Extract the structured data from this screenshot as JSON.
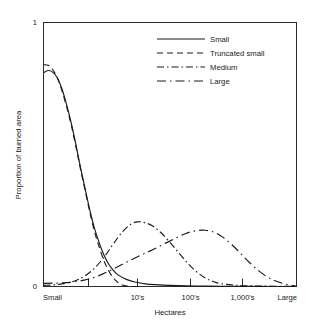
{
  "chart_data": {
    "type": "line",
    "title": "",
    "subtitle": "",
    "xlabel": "Hectares",
    "ylabel": "Proportion of burned area",
    "grid": false,
    "legend_position": "top-right",
    "xlim": [
      0,
      1
    ],
    "ylim": [
      0,
      1
    ],
    "y_ticks": [
      0,
      1
    ],
    "y_tick_labels": [
      "0",
      "1"
    ],
    "x_ticks": [
      0.0,
      0.1765,
      0.3725,
      0.5804,
      0.7843,
      1.0
    ],
    "x_tick_labels": [
      "Small",
      "",
      "10's",
      "100's",
      "1,000's",
      "Large"
    ],
    "x_major_tick_labels": [
      "Small",
      "10's",
      "100's",
      "1,000's",
      "Large"
    ],
    "annotations": [],
    "series": [
      {
        "name": "Small",
        "style": "solid",
        "dash": "none",
        "color": "#1a1a1a",
        "x": [
          0.0,
          0.018,
          0.036,
          0.055,
          0.073,
          0.091,
          0.11,
          0.128,
          0.146,
          0.165,
          0.183,
          0.201,
          0.22,
          0.238,
          0.256,
          0.275,
          0.293,
          0.33,
          0.366,
          0.403,
          0.44,
          0.5,
          0.6,
          0.7,
          0.8,
          0.9,
          1.0
        ],
        "y": [
          0.81,
          0.818,
          0.812,
          0.79,
          0.748,
          0.69,
          0.618,
          0.538,
          0.452,
          0.368,
          0.29,
          0.222,
          0.166,
          0.121,
          0.087,
          0.062,
          0.045,
          0.026,
          0.016,
          0.01,
          0.007,
          0.004,
          0.002,
          0.001,
          0.001,
          0.0,
          0.0
        ]
      },
      {
        "name": "Truncated small",
        "style": "dashed",
        "dash": "6,4",
        "color": "#1a1a1a",
        "x": [
          0.0,
          0.018,
          0.036,
          0.055,
          0.073,
          0.091,
          0.11,
          0.128,
          0.146,
          0.165,
          0.183,
          0.201,
          0.22,
          0.238,
          0.256,
          0.275,
          0.293,
          0.311,
          0.33,
          0.35,
          0.38
        ],
        "y": [
          0.84,
          0.838,
          0.822,
          0.79,
          0.742,
          0.682,
          0.61,
          0.53,
          0.446,
          0.362,
          0.282,
          0.21,
          0.15,
          0.1,
          0.062,
          0.034,
          0.016,
          0.006,
          0.002,
          0.0,
          0.0
        ]
      },
      {
        "name": "Medium",
        "style": "dash-dot",
        "dash": "7,3,1.5,3",
        "color": "#1a1a1a",
        "x": [
          0.0,
          0.06,
          0.12,
          0.16,
          0.2,
          0.24,
          0.275,
          0.31,
          0.345,
          0.373,
          0.4,
          0.43,
          0.46,
          0.49,
          0.52,
          0.55,
          0.58,
          0.61,
          0.64,
          0.67,
          0.7,
          0.76,
          0.83,
          0.91,
          1.0
        ],
        "y": [
          0.004,
          0.008,
          0.02,
          0.038,
          0.068,
          0.112,
          0.16,
          0.205,
          0.236,
          0.245,
          0.242,
          0.23,
          0.208,
          0.178,
          0.144,
          0.11,
          0.078,
          0.052,
          0.032,
          0.019,
          0.011,
          0.005,
          0.002,
          0.001,
          0.0
        ]
      },
      {
        "name": "Large",
        "style": "long-dash",
        "dash": "9,4,1.5,4",
        "color": "#1a1a1a",
        "x": [
          0.0,
          0.05,
          0.11,
          0.16,
          0.2,
          0.24,
          0.275,
          0.32,
          0.37,
          0.42,
          0.47,
          0.52,
          0.56,
          0.6,
          0.64,
          0.675,
          0.71,
          0.745,
          0.78,
          0.815,
          0.85,
          0.885,
          0.92,
          0.96,
          1.0
        ],
        "y": [
          0.012,
          0.013,
          0.016,
          0.024,
          0.034,
          0.05,
          0.066,
          0.088,
          0.112,
          0.134,
          0.158,
          0.182,
          0.2,
          0.211,
          0.213,
          0.205,
          0.186,
          0.158,
          0.124,
          0.09,
          0.06,
          0.036,
          0.02,
          0.008,
          0.002
        ]
      }
    ]
  },
  "legend": {
    "entries": [
      {
        "label": "Small"
      },
      {
        "label": "Truncated small"
      },
      {
        "label": "Medium"
      },
      {
        "label": "Large"
      }
    ]
  },
  "axes": {
    "y_top_label": "1",
    "y_bottom_label": "0",
    "y_title": "Proportion of burned area",
    "x_title": "Hectares",
    "x_labels": {
      "small": "Small",
      "tens": "10's",
      "hundreds": "100's",
      "thousands": "1,000's",
      "large": "Large"
    }
  }
}
